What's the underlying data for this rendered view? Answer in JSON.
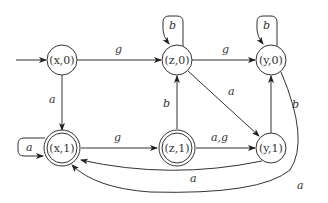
{
  "diagram": {
    "type": "state-machine",
    "nodes": [
      {
        "id": "x0",
        "label": "(x,0)",
        "accepting": false,
        "initial": true
      },
      {
        "id": "z0",
        "label": "(z,0)",
        "accepting": false,
        "initial": false
      },
      {
        "id": "y0",
        "label": "(y,0)",
        "accepting": false,
        "initial": false
      },
      {
        "id": "x1",
        "label": "(x,1)",
        "accepting": true,
        "initial": false
      },
      {
        "id": "z1",
        "label": "(z,1)",
        "accepting": true,
        "initial": false
      },
      {
        "id": "y1",
        "label": "(y,1)",
        "accepting": false,
        "initial": false
      }
    ],
    "edges": [
      {
        "from": "x0",
        "to": "z0",
        "label": "g"
      },
      {
        "from": "z0",
        "to": "y0",
        "label": "g"
      },
      {
        "from": "z0",
        "to": "z0",
        "label": "b"
      },
      {
        "from": "y0",
        "to": "y0",
        "label": "b"
      },
      {
        "from": "x0",
        "to": "x1",
        "label": "a"
      },
      {
        "from": "x1",
        "to": "x1",
        "label": "a"
      },
      {
        "from": "x1",
        "to": "z1",
        "label": "g"
      },
      {
        "from": "z1",
        "to": "z0",
        "label": "b"
      },
      {
        "from": "z0",
        "to": "y1",
        "label": "a"
      },
      {
        "from": "z1",
        "to": "y1",
        "label": "a,g"
      },
      {
        "from": "y1",
        "to": "y0",
        "label": "b"
      },
      {
        "from": "y1",
        "to": "x1",
        "label": "a"
      },
      {
        "from": "y0",
        "to": "x1",
        "label": "a"
      }
    ]
  }
}
